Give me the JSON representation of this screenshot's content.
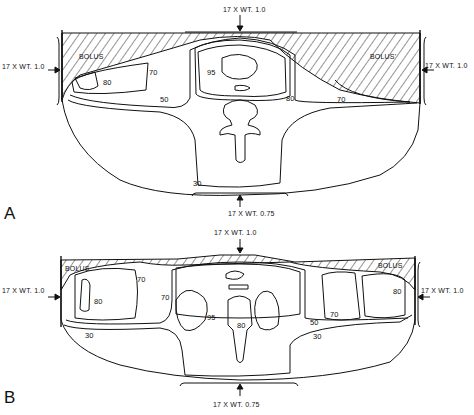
{
  "figure": {
    "panels": [
      {
        "id": "A",
        "label": "A",
        "beams": {
          "top": "17 X WT. 1.0",
          "left": "17 X WT. 1.0",
          "right": "17 X WT. 1.0",
          "bottom": "17 X WT. 0.75"
        },
        "bolus_labels": [
          "BOLUS",
          "BOLUS'"
        ],
        "isodose": [
          "95",
          "80",
          "70",
          "50",
          "80",
          "70",
          "30"
        ]
      },
      {
        "id": "B",
        "label": "B",
        "beams": {
          "top": "17 X WT. 1.0",
          "left": "17 X WT. 1.0",
          "right": "17 X WT. 1.0",
          "bottom": "17 X WT. 0.75"
        },
        "bolus_labels": [
          "BOLUS",
          "BOLUS"
        ],
        "isodose": [
          "80",
          "70",
          "70",
          "95",
          "80",
          "50",
          "30",
          "70",
          "80",
          "30"
        ]
      }
    ],
    "colors": {
      "line": "#111111",
      "background": "#ffffff"
    }
  }
}
